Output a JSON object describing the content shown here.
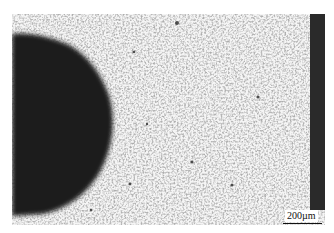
{
  "image": {
    "description": "Optical micrograph: dark rounded particle at left, fine dispersed speckled microstructure across light matrix, dark band at right edge",
    "colors": {
      "background": "#ffffff",
      "matrix": "#f4f4f4",
      "particle": "#1c1c1c",
      "band": "#2a2a2a",
      "speckle": "#555555"
    }
  },
  "scale_bar": {
    "label": "200µm"
  }
}
